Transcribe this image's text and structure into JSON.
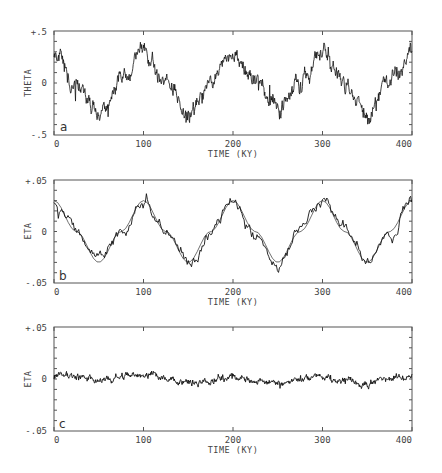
{
  "chart_data": [
    {
      "type": "line",
      "panel_label": "a",
      "ylabel": "THETA",
      "xlabel": "TIME (KY)",
      "xlim": [
        0,
        400
      ],
      "ylim": [
        -0.5,
        0.5
      ],
      "xticks": [
        "0",
        "100",
        "200",
        "300",
        "400"
      ],
      "yticks": [
        "+.5",
        "0",
        "-.5"
      ],
      "grid": false,
      "series": [
        {
          "name": "theta (noisy)",
          "style": "noisy",
          "x": [
            0,
            25,
            50,
            75,
            100,
            125,
            150,
            175,
            200,
            225,
            250,
            275,
            300,
            325,
            350,
            375,
            400
          ],
          "values": [
            0.3,
            0.0,
            -0.3,
            0.0,
            0.3,
            0.0,
            -0.3,
            0.0,
            0.3,
            0.0,
            -0.3,
            0.0,
            0.3,
            0.0,
            -0.3,
            0.0,
            0.3
          ]
        }
      ]
    },
    {
      "type": "line",
      "panel_label": "b",
      "ylabel": "ETA",
      "xlabel": "TIME (KY)",
      "xlim": [
        0,
        400
      ],
      "ylim": [
        -0.05,
        0.05
      ],
      "xticks": [
        "0",
        "100",
        "200",
        "300",
        "400"
      ],
      "yticks": [
        "+.05",
        "0",
        "-.05"
      ],
      "grid": false,
      "series": [
        {
          "name": "eta (noisy)",
          "style": "noisy",
          "x": [
            0,
            25,
            50,
            75,
            100,
            125,
            150,
            175,
            200,
            225,
            250,
            275,
            300,
            325,
            350,
            375,
            400
          ],
          "values": [
            0.03,
            0.0,
            -0.03,
            0.0,
            0.03,
            0.0,
            -0.03,
            0.0,
            0.03,
            0.0,
            -0.03,
            0.0,
            0.03,
            0.0,
            -0.03,
            0.0,
            0.03
          ]
        },
        {
          "name": "eta (smooth)",
          "style": "smooth",
          "x": [
            0,
            25,
            50,
            75,
            100,
            125,
            150,
            175,
            200,
            225,
            250,
            275,
            300,
            325,
            350,
            375,
            400
          ],
          "values": [
            0.03,
            0.0,
            -0.03,
            0.0,
            0.03,
            0.0,
            -0.03,
            0.0,
            0.03,
            0.0,
            -0.03,
            0.0,
            0.03,
            0.0,
            -0.03,
            0.0,
            0.03
          ]
        }
      ]
    },
    {
      "type": "line",
      "panel_label": "c",
      "ylabel": "ETA",
      "xlabel": "TIME (KY)",
      "xlim": [
        0,
        400
      ],
      "ylim": [
        -0.05,
        0.05
      ],
      "xticks": [
        "0",
        "100",
        "200",
        "300",
        "400"
      ],
      "yticks": [
        "+.05",
        "0",
        "-.05"
      ],
      "grid": false,
      "series": [
        {
          "name": "eta residual",
          "style": "noisy",
          "x": [
            0,
            50,
            100,
            150,
            200,
            250,
            300,
            350,
            400
          ],
          "values": [
            0.003,
            -0.002,
            0.004,
            -0.003,
            0.002,
            -0.004,
            0.003,
            -0.003,
            0.003
          ]
        }
      ]
    }
  ],
  "panels": [
    {
      "letter": "a",
      "ylabel": "THETA",
      "ytop": "+.5",
      "ymid": "0",
      "ybot": "-.5",
      "xlabel": "TIME (KY)",
      "xticks": [
        "0",
        "100",
        "200",
        "300",
        "400"
      ]
    },
    {
      "letter": "b",
      "ylabel": "ETA",
      "ytop": "+.05",
      "ymid": "0",
      "ybot": "-.05",
      "xlabel": "TIME (KY)",
      "xticks": [
        "0",
        "100",
        "200",
        "300",
        "400"
      ]
    },
    {
      "letter": "c",
      "ylabel": "ETA",
      "ytop": "+.05",
      "ymid": "0",
      "ybot": "-.05",
      "xlabel": "TIME (KY)",
      "xticks": [
        "0",
        "100",
        "200",
        "300",
        "400"
      ]
    }
  ]
}
